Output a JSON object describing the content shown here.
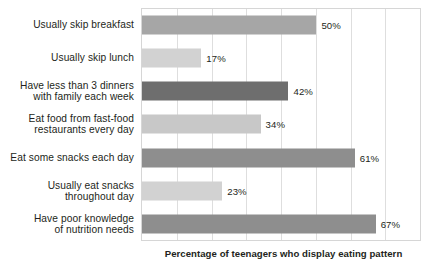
{
  "chart_data": {
    "type": "bar",
    "orientation": "horizontal",
    "title": "",
    "xlabel": "Percentage of teenagers who display eating pattern",
    "ylabel": "",
    "xlim": [
      0,
      80
    ],
    "grid": true,
    "grid_step": 10,
    "tick_labels": [],
    "legend": "none",
    "categories": [
      "Usually skip breakfast",
      "Usually skip lunch",
      "Have less than 3 dinners with family each week",
      "Eat food from fast-food restaurants every day",
      "Eat some snacks each day",
      "Usually eat snacks throughout day",
      "Have poor knowledge of nutrition needs"
    ],
    "values": [
      50,
      17,
      42,
      34,
      61,
      23,
      67
    ],
    "value_labels": [
      "50%",
      "17%",
      "42%",
      "34%",
      "61%",
      "23%",
      "67%"
    ],
    "bar_colors": [
      "#a6a6a6",
      "#d2d2d2",
      "#6e6e6e",
      "#c8c8c8",
      "#8e8e8e",
      "#d2d2d2",
      "#8e8e8e"
    ],
    "bars": [
      {
        "label_line1": "Usually skip breakfast",
        "label_line2": "",
        "value": 50,
        "value_label": "50%",
        "color": "#a6a6a6"
      },
      {
        "label_line1": "Usually skip lunch",
        "label_line2": "",
        "value": 17,
        "value_label": "17%",
        "color": "#d2d2d2"
      },
      {
        "label_line1": "Have less than 3 dinners",
        "label_line2": "with family each week",
        "value": 42,
        "value_label": "42%",
        "color": "#6e6e6e"
      },
      {
        "label_line1": "Eat food from fast-food",
        "label_line2": "restaurants every day",
        "value": 34,
        "value_label": "34%",
        "color": "#c8c8c8"
      },
      {
        "label_line1": "Eat some snacks each day",
        "label_line2": "",
        "value": 61,
        "value_label": "61%",
        "color": "#8e8e8e"
      },
      {
        "label_line1": "Usually eat snacks",
        "label_line2": "throughout day",
        "value": 23,
        "value_label": "23%",
        "color": "#d2d2d2"
      },
      {
        "label_line1": "Have poor knowledge",
        "label_line2": "of nutrition needs",
        "value": 67,
        "value_label": "67%",
        "color": "#8e8e8e"
      }
    ]
  },
  "style": {
    "plot_border_color": "#d6d6d6",
    "gridline_color": "#dedede",
    "text_color": "#231f20",
    "background": "#ffffff"
  }
}
